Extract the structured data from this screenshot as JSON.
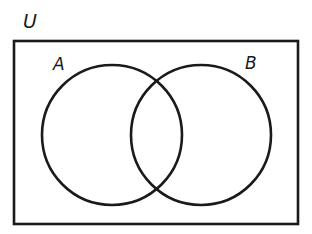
{
  "diagram": {
    "type": "venn",
    "stroke_color": "#1a1a1a",
    "background_color": "#ffffff",
    "universe": {
      "label": "U",
      "rect": {
        "x": 14,
        "y": 41,
        "width": 284,
        "height": 183
      }
    },
    "sets": [
      {
        "id": "A",
        "label": "A",
        "cx": 112,
        "cy": 135,
        "r": 70
      },
      {
        "id": "B",
        "label": "B",
        "cx": 201,
        "cy": 135,
        "r": 70
      }
    ]
  }
}
